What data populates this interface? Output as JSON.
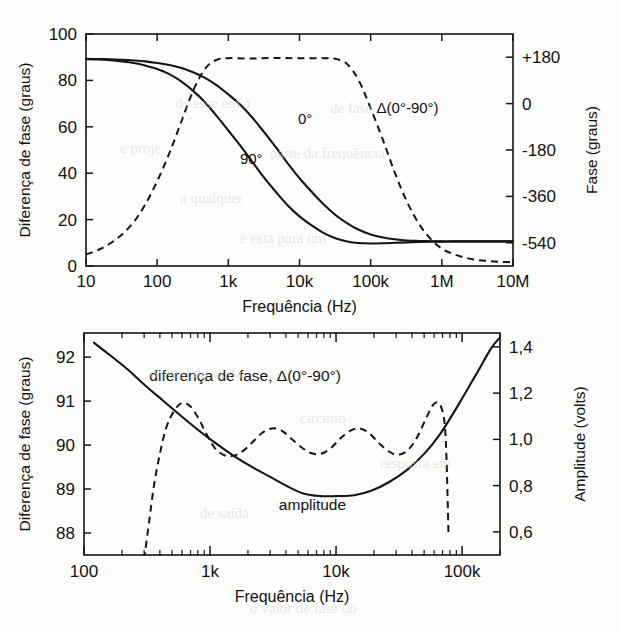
{
  "page": {
    "width": 619,
    "height": 631,
    "background": "#fdfdfc",
    "ink_color": "#141414"
  },
  "chart_data": [
    {
      "id": "top",
      "type": "line",
      "title": "",
      "xlabel": "Frequência (Hz)",
      "ylabel": "Diferença de fase (graus)",
      "y2label": "Fase (graus)",
      "xscale": "log",
      "xlim": [
        10,
        10000000
      ],
      "ylim": [
        0,
        100
      ],
      "y2lim": [
        -630,
        270
      ],
      "xticks": [
        10,
        100,
        1000,
        10000,
        100000,
        1000000,
        10000000
      ],
      "xticklabels": [
        "10",
        "100",
        "1k",
        "10k",
        "100k",
        "1M",
        "10M"
      ],
      "yticks": [
        0,
        20,
        40,
        60,
        80,
        100
      ],
      "yticklabels": [
        "0",
        "20",
        "40",
        "60",
        "80",
        "100"
      ],
      "y2ticks": [
        180,
        0,
        -180,
        -360,
        -540
      ],
      "y2ticklabels": [
        "+180",
        "0",
        "-180",
        "-360",
        "-540"
      ],
      "grid": false,
      "legend": "inline-annotations",
      "series": [
        {
          "name": "0°",
          "style": "solid",
          "label": "0°",
          "label_x": 12000,
          "label_y": 61,
          "axis": "left",
          "x": [
            10,
            15,
            22,
            32,
            47,
            68,
            100,
            150,
            220,
            320,
            470,
            680,
            1000,
            1500,
            2200,
            3200,
            4700,
            6800,
            10000,
            15000,
            22000,
            32000,
            47000,
            68000,
            100000,
            150000,
            220000,
            320000,
            470000,
            680000,
            1000000,
            1500000,
            2200000,
            3200000,
            4700000,
            6800000,
            10000000
          ],
          "y": [
            89.3,
            89.2,
            89.1,
            88.9,
            88.6,
            88.2,
            87.5,
            86.6,
            85.3,
            83.5,
            81.1,
            78.0,
            74.0,
            69.3,
            63.8,
            57.6,
            51.0,
            44.3,
            37.8,
            31.8,
            26.5,
            22.0,
            18.4,
            15.6,
            13.6,
            12.3,
            11.5,
            11.0,
            10.8,
            10.7,
            10.6,
            10.6,
            10.6,
            10.6,
            10.6,
            10.6,
            10.6
          ]
        },
        {
          "name": "90°",
          "style": "solid",
          "label": "90°",
          "label_x": 2100,
          "label_y": 44,
          "axis": "left",
          "x": [
            10,
            15,
            22,
            32,
            47,
            68,
            100,
            150,
            220,
            320,
            470,
            680,
            1000,
            1500,
            2200,
            3200,
            4700,
            6800,
            10000,
            15000,
            22000,
            32000,
            47000,
            68000,
            100000,
            150000,
            220000,
            320000,
            470000,
            680000,
            1000000,
            1500000,
            2200000,
            3200000,
            4700000,
            6800000,
            10000000
          ],
          "y": [
            89.2,
            89.0,
            88.7,
            88.2,
            87.5,
            86.4,
            84.9,
            82.6,
            79.5,
            75.5,
            70.6,
            64.8,
            58.4,
            51.6,
            44.7,
            38.0,
            31.8,
            26.2,
            21.4,
            17.4,
            14.2,
            12.0,
            10.6,
            9.9,
            9.7,
            9.8,
            10.0,
            10.2,
            10.4,
            10.5,
            10.5,
            10.6,
            10.6,
            10.6,
            10.6,
            10.6,
            10.6
          ]
        },
        {
          "name": "Δ(0°-90°)",
          "style": "dashed",
          "label": "Δ(0°-90°)",
          "label_x": 330000,
          "label_y": 66,
          "axis": "right",
          "x": [
            10,
            15,
            22,
            32,
            47,
            68,
            100,
            150,
            220,
            320,
            470,
            680,
            1000,
            2200,
            4700,
            10000,
            22000,
            32000,
            47000,
            68000,
            100000,
            150000,
            220000,
            320000,
            470000,
            680000,
            1000000,
            1500000,
            2200000,
            3200000,
            4700000,
            6800000,
            10000000
          ],
          "y_left": [
            5.0,
            7.0,
            9.8,
            13.6,
            19.0,
            26.5,
            36.5,
            49.0,
            62.5,
            75.5,
            85.0,
            88.8,
            89.6,
            89.4,
            89.7,
            89.5,
            89.6,
            89.3,
            87.0,
            80.0,
            68.0,
            54.0,
            40.0,
            28.0,
            18.5,
            12.0,
            7.5,
            5.0,
            3.5,
            2.6,
            2.1,
            1.8,
            1.6
          ]
        }
      ]
    },
    {
      "id": "bottom",
      "type": "line",
      "title": "",
      "xlabel": "Frequência (Hz)",
      "ylabel": "Diferença de fase (graus)",
      "y2label": "Amplitude (volts)",
      "xscale": "log",
      "xlim": [
        100,
        200000
      ],
      "ylim": [
        87.5,
        92.55
      ],
      "y2lim": [
        0.5,
        1.46
      ],
      "xticks": [
        100,
        1000,
        10000,
        100000
      ],
      "xticklabels": [
        "100",
        "1k",
        "10k",
        "100k"
      ],
      "yticks": [
        88,
        89,
        90,
        91,
        92
      ],
      "yticklabels": [
        "88",
        "89",
        "90",
        "91",
        "92"
      ],
      "y2ticks": [
        0.6,
        0.8,
        1.0,
        1.2,
        1.4
      ],
      "y2ticklabels": [
        "0,6",
        "0,8",
        "1,0",
        "1,2",
        "1,4"
      ],
      "grid": false,
      "legend": "inline-annotations",
      "annotations": [
        {
          "text": "diferença de fase, Δ(0°-90°)",
          "x": 1900,
          "y": 91.45
        },
        {
          "text": "amplitude",
          "x": 6500,
          "y": 88.53
        }
      ],
      "series": [
        {
          "name": "amplitude",
          "style": "solid",
          "axis": "right",
          "x": [
            120,
            160,
            220,
            300,
            420,
            580,
            800,
            1100,
            1500,
            2100,
            2900,
            4000,
            5500,
            7500,
            10000,
            14000,
            19000,
            26000,
            36000,
            50000,
            68000,
            95000,
            130000,
            170000,
            200000
          ],
          "y_left": [
            92.33,
            92.05,
            91.73,
            91.38,
            91.02,
            90.68,
            90.35,
            90.05,
            89.78,
            89.52,
            89.3,
            89.08,
            88.9,
            88.84,
            88.84,
            88.86,
            88.96,
            89.15,
            89.42,
            89.8,
            90.28,
            90.95,
            91.62,
            92.2,
            92.45
          ]
        },
        {
          "name": "diferença de fase, Δ(0°-90°)",
          "style": "dashed",
          "axis": "left",
          "x": [
            300,
            330,
            360,
            400,
            450,
            520,
            600,
            700,
            820,
            950,
            1100,
            1300,
            1550,
            1850,
            2200,
            2600,
            3100,
            3700,
            4400,
            5300,
            6300,
            7500,
            9000,
            10700,
            12800,
            15300,
            18200,
            21700,
            26000,
            31000,
            37000,
            44000,
            52000,
            60000,
            68000,
            74000,
            78000
          ],
          "y_left": [
            87.4,
            88.3,
            89.1,
            89.8,
            90.4,
            90.78,
            90.96,
            90.88,
            90.58,
            90.22,
            89.92,
            89.77,
            89.76,
            89.88,
            90.08,
            90.28,
            90.38,
            90.33,
            90.15,
            89.95,
            89.82,
            89.8,
            89.92,
            90.14,
            90.32,
            90.38,
            90.28,
            90.06,
            89.86,
            89.78,
            89.88,
            90.18,
            90.62,
            90.94,
            90.88,
            90.2,
            88.0
          ]
        }
      ]
    }
  ],
  "ghost_text": [
    {
      "text": "de esse em  a",
      "x": 175,
      "y": 95
    },
    {
      "text": "de fase",
      "x": 330,
      "y": 100
    },
    {
      "text": "e  proje",
      "x": 120,
      "y": 140
    },
    {
      "text": "parte da frequência",
      "x": 270,
      "y": 145
    },
    {
      "text": "a  qualquer",
      "x": 180,
      "y": 190
    },
    {
      "text": "e   esta  para  um",
      "x": 240,
      "y": 230
    },
    {
      "text": "o sinal de saída",
      "x": 150,
      "y": 365
    },
    {
      "text": "circuito",
      "x": 300,
      "y": 410
    },
    {
      "text": "resposta  em",
      "x": 380,
      "y": 455
    },
    {
      "text": "de  saída",
      "x": 200,
      "y": 505
    },
    {
      "text": "o  valor  de  fase  do",
      "x": 250,
      "y": 600
    }
  ]
}
